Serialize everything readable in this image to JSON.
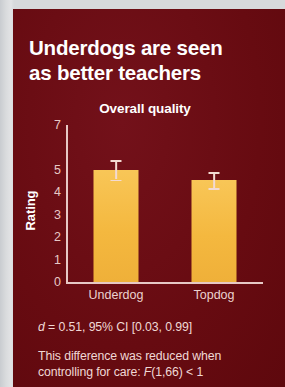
{
  "card": {
    "background_color": "#6a0c12",
    "title_line1": "Underdogs are seen",
    "title_line2": "as better teachers"
  },
  "chart_data": {
    "type": "bar",
    "title": "Overall quality",
    "xlabel": "",
    "ylabel": "Rating",
    "categories": [
      "Underdog",
      "Topdog"
    ],
    "values": [
      5.0,
      4.55
    ],
    "errors": [
      0.43,
      0.36
    ],
    "ylim": [
      0,
      7
    ],
    "ytick_labels": [
      "7",
      "5",
      "4",
      "3",
      "2",
      "1",
      "0"
    ],
    "ytick_values": [
      7,
      5,
      4,
      3,
      2,
      1,
      0
    ],
    "grid": false,
    "legend": "none",
    "bar_color": "#f4b83f",
    "error_color": "#f3dad2",
    "axis_color": "#e7c8c5"
  },
  "footer": {
    "effect_size_prefix": "d",
    "effect_size_rest": " = 0.51, 95% CI [0.03, 0.99]",
    "note_part1": "This difference was reduced when controlling for care: ",
    "note_stat_italic": "F",
    "note_part2": "(1,66) < 1"
  }
}
